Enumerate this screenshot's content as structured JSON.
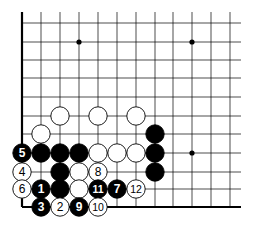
{
  "diagram": {
    "type": "go-board-corner",
    "grid": {
      "col_x": [
        22,
        41,
        60,
        79,
        98,
        117,
        136,
        155,
        173,
        192,
        211,
        230
      ],
      "row_y_from_bottom": [
        207,
        189,
        172,
        153,
        134,
        116,
        97,
        78,
        60,
        42,
        23
      ],
      "top_y": 12,
      "right_x": 241
    },
    "star_points": [
      {
        "col": 3,
        "row": 9
      },
      {
        "col": 9,
        "row": 9
      },
      {
        "col": 9,
        "row": 3
      }
    ],
    "stones": [
      {
        "color": "white",
        "col": 2,
        "row": 5,
        "label": ""
      },
      {
        "color": "white",
        "col": 4,
        "row": 5,
        "label": ""
      },
      {
        "color": "white",
        "col": 6,
        "row": 5,
        "label": ""
      },
      {
        "color": "white",
        "col": 1,
        "row": 4,
        "label": ""
      },
      {
        "color": "black",
        "col": 7,
        "row": 4,
        "label": ""
      },
      {
        "color": "black",
        "col": 0,
        "row": 3,
        "label": "5"
      },
      {
        "color": "black",
        "col": 1,
        "row": 3,
        "label": ""
      },
      {
        "color": "black",
        "col": 2,
        "row": 3,
        "label": ""
      },
      {
        "color": "black",
        "col": 3,
        "row": 3,
        "label": ""
      },
      {
        "color": "white",
        "col": 4,
        "row": 3,
        "label": ""
      },
      {
        "color": "white",
        "col": 5,
        "row": 3,
        "label": ""
      },
      {
        "color": "white",
        "col": 6,
        "row": 3,
        "label": ""
      },
      {
        "color": "black",
        "col": 7,
        "row": 3,
        "label": ""
      },
      {
        "color": "white",
        "col": 0,
        "row": 2,
        "label": "4"
      },
      {
        "color": "black",
        "col": 2,
        "row": 2,
        "label": ""
      },
      {
        "color": "white",
        "col": 3,
        "row": 2,
        "label": ""
      },
      {
        "color": "white",
        "col": 4,
        "row": 2,
        "label": "8"
      },
      {
        "color": "black",
        "col": 7,
        "row": 2,
        "label": ""
      },
      {
        "color": "white",
        "col": 0,
        "row": 1,
        "label": "6"
      },
      {
        "color": "black",
        "col": 1,
        "row": 1,
        "label": "1"
      },
      {
        "color": "black",
        "col": 2,
        "row": 1,
        "label": ""
      },
      {
        "color": "white",
        "col": 3,
        "row": 1,
        "label": ""
      },
      {
        "color": "black",
        "col": 4,
        "row": 1,
        "label": "11"
      },
      {
        "color": "black",
        "col": 5,
        "row": 1,
        "label": "7"
      },
      {
        "color": "white",
        "col": 6,
        "row": 1,
        "label": "12"
      },
      {
        "color": "black",
        "col": 1,
        "row": 0,
        "label": "3"
      },
      {
        "color": "white",
        "col": 2,
        "row": 0,
        "label": "2"
      },
      {
        "color": "black",
        "col": 3,
        "row": 0,
        "label": "9"
      },
      {
        "color": "white",
        "col": 4,
        "row": 0,
        "label": "10"
      }
    ],
    "colors": {
      "line": "#000000",
      "black_stone": "#000000",
      "white_stone": "#ffffff",
      "background": "#ffffff"
    }
  }
}
